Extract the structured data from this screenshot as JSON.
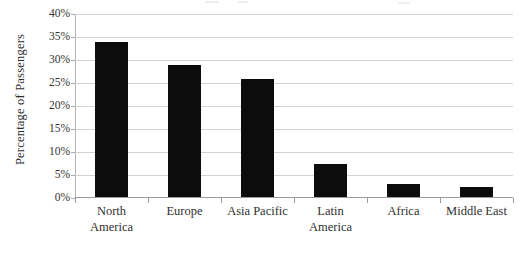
{
  "chart_data": {
    "type": "bar",
    "title": "",
    "subtitle": "",
    "xlabel": "",
    "ylabel": "Percentage of Passengers",
    "categories": [
      "North America",
      "Europe",
      "Asia Pacific",
      "Latin America",
      "Africa",
      "Middle East"
    ],
    "category_lines": [
      [
        "North",
        "America"
      ],
      [
        "Europe"
      ],
      [
        "Asia Pacific"
      ],
      [
        "Latin",
        "America"
      ],
      [
        "Africa"
      ],
      [
        "Middle East"
      ]
    ],
    "values": [
      33.7,
      28.7,
      25.6,
      7.2,
      2.9,
      2.2
    ],
    "ylim": [
      0,
      40
    ],
    "ytick_values": [
      40,
      35,
      30,
      25,
      20,
      15,
      10,
      5,
      0
    ],
    "ytick_labels": [
      "40%",
      "35%",
      "30%",
      "25%",
      "20%",
      "15%",
      "10%",
      "5%",
      "0%"
    ],
    "grid": true,
    "legend": false,
    "legend_position": "none",
    "bar_color": "#0c0c0c",
    "gridline_color": "#d2d2d2",
    "axis_color": "#9a9a9a"
  }
}
